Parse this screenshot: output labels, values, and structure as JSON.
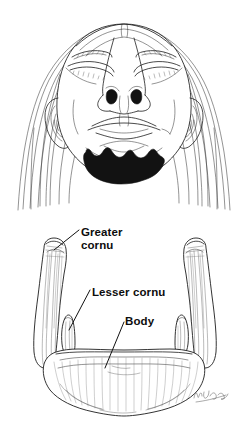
{
  "figure": {
    "background_color": "#ffffff",
    "ink_color": "#1d1d1d",
    "panels": [
      {
        "id": "in-situ",
        "name": "face-inferior-view",
        "description": "Face viewed from below with hyoid bone shaded in solid black beneath the chin"
      },
      {
        "id": "isolated-bone",
        "name": "hyoid-bone-superior-view",
        "description": "Isolated hyoid bone drawn from above showing body, lesser cornua and greater cornua"
      }
    ]
  },
  "labels": {
    "greater_cornu": "Greater\ncornu",
    "lesser_cornu": "Lesser cornu",
    "body": "Body"
  },
  "signature": {
    "artist_mark": "",
    "description": "cursive artist signature"
  }
}
